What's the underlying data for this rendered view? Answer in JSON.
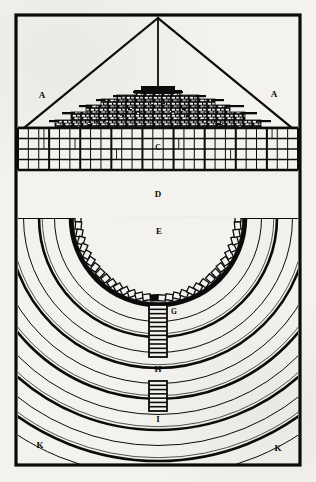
{
  "plate": {
    "domain_kind": "historical-engraving-architectural-plate",
    "description": "Antique printed plate showing a stepped mound (elevation, top) above a semicircular tiered amphitheatre (plan, bottom), with alphabetic reference keys.",
    "background_color": "#f3f2ee",
    "ink_color": "#0b0b0b",
    "width": 316,
    "height": 482
  },
  "frame": {
    "name": "plate-border",
    "x": 16,
    "y": 15,
    "width": 284,
    "height": 450,
    "stroke_width": 3.2
  },
  "upper_elevation": {
    "name": "elevation-view",
    "apex": {
      "x": 158,
      "y": 18
    },
    "diagonals": [
      {
        "name": "left-diagonal",
        "x1": 158,
        "y1": 18,
        "x2": 24,
        "y2": 128
      },
      {
        "name": "right-diagonal",
        "x1": 158,
        "y1": 18,
        "x2": 292,
        "y2": 128
      }
    ],
    "plumb_line": {
      "name": "center-plumb-line",
      "x1": 158,
      "y1": 18,
      "x2": 158,
      "y2": 96
    },
    "labels": [
      {
        "id": "A-left",
        "text": "A",
        "x": 42,
        "y": 96
      },
      {
        "id": "A-right",
        "text": "A",
        "x": 274,
        "y": 95
      }
    ],
    "mound": {
      "name": "stepped-mound",
      "baseline_y": 128,
      "apex_y": 92,
      "left_x": 56,
      "right_x": 262,
      "tiers": 6
    }
  },
  "grid_band": {
    "name": "masonry-grid-band",
    "x": 18,
    "y": 128,
    "width": 280,
    "height": 42,
    "columns": 27,
    "rows": 4,
    "label": {
      "id": "C",
      "text": "C",
      "x": 158,
      "y": 148
    }
  },
  "blank_band": {
    "name": "blank-band",
    "x": 18,
    "y": 172,
    "width": 280,
    "height": 44,
    "label": {
      "id": "D",
      "text": "D",
      "x": 158,
      "y": 195
    }
  },
  "plan_amphitheatre": {
    "name": "amphitheatre-plan",
    "center": {
      "x": 158,
      "y": 218
    },
    "top_edge_y": 218,
    "arena_label": {
      "id": "E",
      "text": "E",
      "x": 159,
      "y": 232
    },
    "niche_ring": {
      "name": "niche-ring",
      "radius": 80,
      "count": 34,
      "niche_w": 7.5,
      "niche_h": 6
    },
    "arcs": {
      "name": "concentric-tier-arcs",
      "count": 12,
      "inner_radius": 88,
      "step": 15.5,
      "thin_stroke": 1.0,
      "thick_stroke": 2.6
    },
    "stairs": [
      {
        "id": "stair-G",
        "x": 149,
        "y": 305,
        "width": 18,
        "height": 52,
        "treads": 12
      },
      {
        "id": "stair-I",
        "x": 149,
        "y": 381,
        "width": 18,
        "height": 30,
        "treads": 7
      }
    ],
    "labels": [
      {
        "id": "G",
        "text": "G",
        "x": 174,
        "y": 312
      },
      {
        "id": "H",
        "text": "H",
        "x": 158,
        "y": 370
      },
      {
        "id": "I",
        "text": "I",
        "x": 158,
        "y": 420
      },
      {
        "id": "K-left",
        "text": "K",
        "x": 40,
        "y": 446
      },
      {
        "id": "K-right",
        "text": "K",
        "x": 278,
        "y": 449
      }
    ]
  },
  "legend_keys": [
    {
      "key": "A",
      "role": "outer sight-lines / enclosing triangle"
    },
    {
      "key": "C",
      "role": "gridded substructure course"
    },
    {
      "key": "D",
      "role": "plain intermediate band"
    },
    {
      "key": "E",
      "role": "central arena"
    },
    {
      "key": "G",
      "role": "upper stair flight"
    },
    {
      "key": "H",
      "role": "landing between flights"
    },
    {
      "key": "I",
      "role": "lower stair flight"
    },
    {
      "key": "K",
      "role": "outer corner ground"
    }
  ]
}
